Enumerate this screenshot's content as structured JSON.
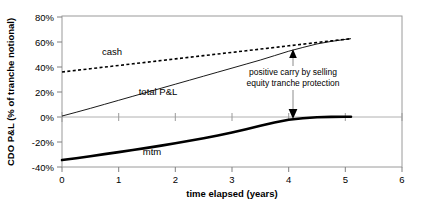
{
  "chart_data": {
    "type": "line",
    "title": "",
    "xlabel": "time elapsed (years)",
    "ylabel": "CDO P&L (% of tranche notional)",
    "xlim": [
      0,
      6
    ],
    "ylim": [
      -40,
      80
    ],
    "xticks": [
      "0",
      "1",
      "2",
      "3",
      "4",
      "5",
      "6"
    ],
    "xtick_values": [
      0,
      1,
      2,
      3,
      4,
      5,
      6
    ],
    "yticks": [
      "80%",
      "60%",
      "40%",
      "20%",
      "0%",
      "-20%",
      "-40%"
    ],
    "ytick_values": [
      80,
      60,
      40,
      20,
      0,
      -20,
      -40
    ],
    "grid": false,
    "legend_position": "inline-labels",
    "series": [
      {
        "name": "cash",
        "label": "cash",
        "style": "dashed",
        "color": "#000000",
        "x": [
          0.0,
          0.25,
          0.5,
          0.75,
          1.0,
          1.25,
          1.5,
          1.75,
          2.0,
          2.25,
          2.5,
          2.75,
          3.0,
          3.25,
          3.5,
          3.75,
          4.0,
          4.25,
          4.5,
          4.75,
          5.0,
          5.1
        ],
        "values": [
          35.5,
          36.8,
          38.1,
          39.4,
          40.7,
          42.0,
          43.3,
          44.6,
          45.9,
          47.2,
          48.5,
          49.8,
          51.1,
          52.4,
          53.7,
          55.0,
          56.3,
          57.6,
          58.9,
          60.2,
          61.5,
          62.0
        ]
      },
      {
        "name": "total P&L",
        "label": "total P&L",
        "style": "solid-thin",
        "color": "#000000",
        "x": [
          0.0,
          0.25,
          0.5,
          0.75,
          1.0,
          1.25,
          1.5,
          1.75,
          2.0,
          2.25,
          2.5,
          2.75,
          3.0,
          3.25,
          3.5,
          3.75,
          4.0,
          4.25,
          4.5,
          4.75,
          5.0,
          5.1
        ],
        "values": [
          0.5,
          3.5,
          6.6,
          9.8,
          13.0,
          16.2,
          19.4,
          22.6,
          25.8,
          29.0,
          32.2,
          35.4,
          38.6,
          41.8,
          45.0,
          48.5,
          52.0,
          55.0,
          57.8,
          59.8,
          61.4,
          62.0
        ]
      },
      {
        "name": "mtm",
        "label": "mtm",
        "style": "solid-thick",
        "color": "#000000",
        "x": [
          0.0,
          0.25,
          0.5,
          0.75,
          1.0,
          1.25,
          1.5,
          1.75,
          2.0,
          2.25,
          2.5,
          2.75,
          3.0,
          3.25,
          3.5,
          3.75,
          4.0,
          4.25,
          4.5,
          4.75,
          5.0,
          5.1
        ],
        "values": [
          -34.5,
          -33.0,
          -31.4,
          -29.8,
          -28.2,
          -26.5,
          -24.8,
          -23.0,
          -21.2,
          -19.2,
          -17.2,
          -15.0,
          -12.6,
          -10.0,
          -7.2,
          -4.6,
          -2.5,
          -1.2,
          -0.5,
          -0.2,
          -0.1,
          -0.1
        ]
      }
    ],
    "annotations": [
      {
        "name": "positive-carry-annotation",
        "text_line1": "positive carry by selling",
        "text_line2": "equity tranche protection",
        "arrow": "double-headed-vertical",
        "x": 4.05,
        "y_top": 55,
        "y_bottom": 0
      }
    ]
  },
  "colors": {
    "axis": "#808080",
    "series": "#000000",
    "background": "#ffffff",
    "text": "#000000"
  },
  "labels": {
    "cash": "cash",
    "total_pl": "total P&L",
    "mtm": "mtm"
  }
}
